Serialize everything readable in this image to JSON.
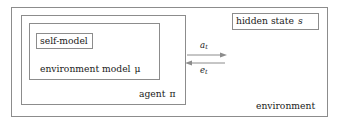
{
  "diagram": {
    "boxes": {
      "environment": {
        "label": "environment",
        "name": "environment-box"
      },
      "agent": {
        "label_text": "agent",
        "label_symbol": "π",
        "name": "agent-box"
      },
      "environment_model": {
        "label_text": "environment model",
        "label_symbol": "μ",
        "name": "environment-model-box"
      },
      "self_model": {
        "label": "self-model",
        "name": "self-model-box"
      },
      "hidden_state": {
        "label_text": "hidden state",
        "label_symbol": "s",
        "name": "hidden-state-box"
      }
    },
    "arrows": {
      "action": {
        "symbol": "a",
        "subscript": "t",
        "direction": "right",
        "from": "agent",
        "to": "environment"
      },
      "percept": {
        "symbol": "e",
        "subscript": "t",
        "direction": "left",
        "from": "environment",
        "to": "agent"
      }
    },
    "colors": {
      "stroke": "#8c8c8c",
      "text": "#1a1a1a",
      "background": "#ffffff"
    }
  }
}
